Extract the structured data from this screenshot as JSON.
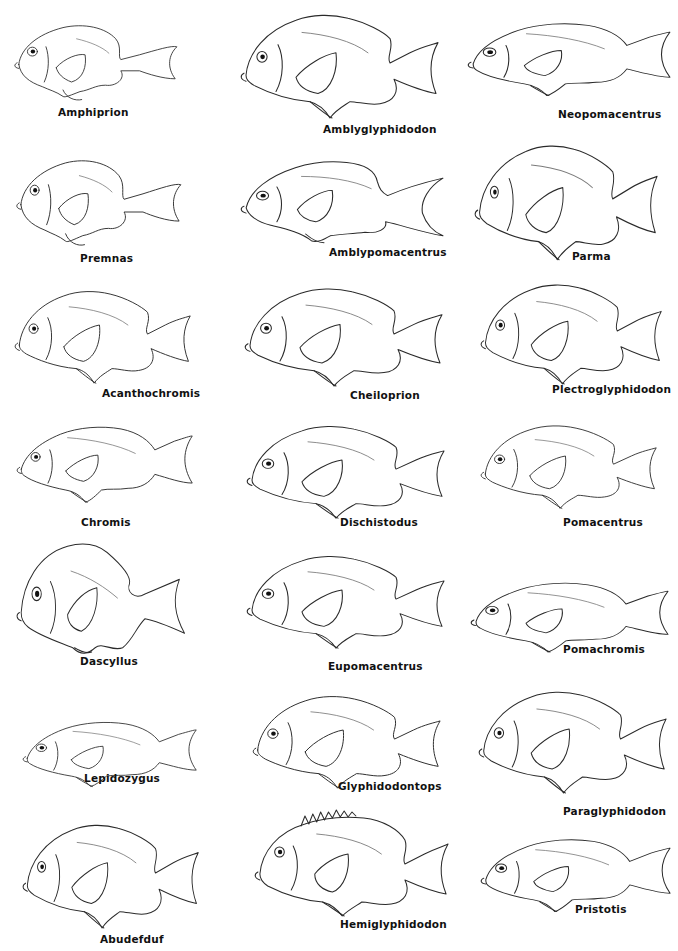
{
  "plate": {
    "background": "#ffffff",
    "line_color": "#2a2a2a",
    "genera": [
      {
        "name": "Amphiprion",
        "x": 12,
        "y": 18,
        "w": 170,
        "h": 88,
        "variant": "round",
        "label_x": 58,
        "label_y": 106
      },
      {
        "name": "Amblyglyphidodon",
        "x": 240,
        "y": 8,
        "w": 200,
        "h": 112,
        "variant": "deep",
        "label_x": 323,
        "label_y": 123
      },
      {
        "name": "Neopomacentrus",
        "x": 467,
        "y": 12,
        "w": 205,
        "h": 92,
        "variant": "slim",
        "label_x": 558,
        "label_y": 108
      },
      {
        "name": "Premnas",
        "x": 14,
        "y": 152,
        "w": 172,
        "h": 100,
        "variant": "round",
        "label_x": 80,
        "label_y": 252
      },
      {
        "name": "Amblypomacentrus",
        "x": 240,
        "y": 152,
        "w": 205,
        "h": 96,
        "variant": "lyre",
        "label_x": 329,
        "label_y": 246
      },
      {
        "name": "Parma",
        "x": 474,
        "y": 138,
        "w": 185,
        "h": 124,
        "variant": "deep",
        "label_x": 572,
        "label_y": 250
      },
      {
        "name": "Acanthochromis",
        "x": 14,
        "y": 285,
        "w": 178,
        "h": 100,
        "variant": "deep",
        "label_x": 102,
        "label_y": 387
      },
      {
        "name": "Cheiloprion",
        "x": 244,
        "y": 282,
        "w": 200,
        "h": 106,
        "variant": "deep",
        "label_x": 350,
        "label_y": 389
      },
      {
        "name": "Plectroglyphidodon",
        "x": 480,
        "y": 278,
        "w": 183,
        "h": 108,
        "variant": "deep",
        "label_x": 552,
        "label_y": 383
      },
      {
        "name": "Chromis",
        "x": 16,
        "y": 415,
        "w": 178,
        "h": 96,
        "variant": "slim",
        "label_x": 81,
        "label_y": 516
      },
      {
        "name": "Dischistodus",
        "x": 246,
        "y": 420,
        "w": 200,
        "h": 100,
        "variant": "deep",
        "label_x": 340,
        "label_y": 516
      },
      {
        "name": "Pomacentrus",
        "x": 480,
        "y": 420,
        "w": 178,
        "h": 90,
        "variant": "deep",
        "label_x": 563,
        "label_y": 516
      },
      {
        "name": "Dascyllus",
        "x": 16,
        "y": 540,
        "w": 172,
        "h": 114,
        "variant": "tall",
        "label_x": 80,
        "label_y": 655
      },
      {
        "name": "Eupomacentrus",
        "x": 246,
        "y": 550,
        "w": 200,
        "h": 100,
        "variant": "deep",
        "label_x": 328,
        "label_y": 660
      },
      {
        "name": "Pomachromis",
        "x": 470,
        "y": 572,
        "w": 200,
        "h": 88,
        "variant": "slim",
        "label_x": 563,
        "label_y": 643
      },
      {
        "name": "Lepidozygus",
        "x": 22,
        "y": 712,
        "w": 176,
        "h": 82,
        "variant": "slim",
        "label_x": 84,
        "label_y": 772
      },
      {
        "name": "Glyphidodontops",
        "x": 252,
        "y": 690,
        "w": 190,
        "h": 100,
        "variant": "deep",
        "label_x": 338,
        "label_y": 780
      },
      {
        "name": "Paraglyphidodon",
        "x": 478,
        "y": 685,
        "w": 190,
        "h": 110,
        "variant": "deep",
        "label_x": 563,
        "label_y": 805
      },
      {
        "name": "Abudefduf",
        "x": 22,
        "y": 818,
        "w": 178,
        "h": 112,
        "variant": "deep",
        "label_x": 100,
        "label_y": 933
      },
      {
        "name": "Hemiglyphidodon",
        "x": 254,
        "y": 808,
        "w": 196,
        "h": 110,
        "variant": "spiny",
        "label_x": 340,
        "label_y": 918
      },
      {
        "name": "Pristotis",
        "x": 480,
        "y": 828,
        "w": 192,
        "h": 92,
        "variant": "slim",
        "label_x": 575,
        "label_y": 903
      }
    ]
  }
}
